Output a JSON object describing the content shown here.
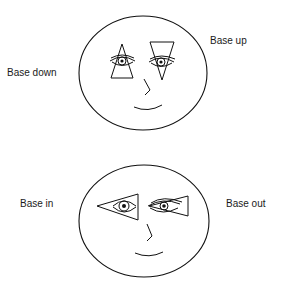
{
  "diagram": {
    "type": "prism-orientation-illustration",
    "panels": [
      {
        "id": "vertical",
        "labels": {
          "left": "Base down",
          "right": "Base up"
        },
        "left_eye_prism": "apex-up-triangle (base down)",
        "right_eye_prism": "apex-down-triangle (base up)"
      },
      {
        "id": "horizontal",
        "labels": {
          "left": "Base in",
          "right": "Base out"
        },
        "left_eye_prism": "apex-left-triangle",
        "right_eye_prism": "apex-left-triangle"
      }
    ],
    "colors": {
      "line": "#111111",
      "background": "#ffffff"
    }
  }
}
